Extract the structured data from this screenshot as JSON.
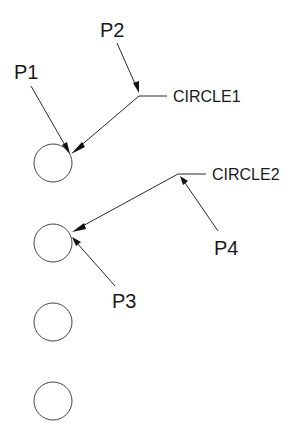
{
  "diagram": {
    "points": [
      {
        "label": "P1"
      },
      {
        "label": "P2"
      },
      {
        "label": "P3"
      },
      {
        "label": "P4"
      }
    ],
    "leaders": [
      {
        "label": "CIRCLE1"
      },
      {
        "label": "CIRCLE2"
      }
    ],
    "circle_count": 4,
    "colors": {
      "line": "#2a2a2a",
      "text": "#1a1a1a",
      "background": "#ffffff"
    }
  }
}
